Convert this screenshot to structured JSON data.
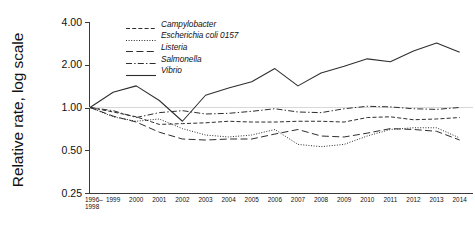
{
  "chart_data": {
    "type": "line",
    "title": "",
    "xlabel": "",
    "ylabel": "Relative rate, log scale",
    "yscale": "log",
    "ylim": [
      0.25,
      4.0
    ],
    "ytick_labels": [
      "4.00",
      "2.00",
      "1.00",
      "0.50",
      "0.25"
    ],
    "ytick_values": [
      4.0,
      2.0,
      1.0,
      0.5,
      0.25
    ],
    "grid": false,
    "reference_line": 1.0,
    "legend_position": "top-center",
    "categories": [
      "1996–\n1998",
      "1999",
      "2000",
      "2001",
      "2002",
      "2003",
      "2004",
      "2005",
      "2006",
      "2007",
      "2008",
      "2009",
      "2010",
      "2011",
      "2012",
      "2013",
      "2014"
    ],
    "x_tick_labels": [
      "1996–|1998",
      "1999",
      "2000",
      "2001",
      "2002",
      "2003",
      "2004",
      "2005",
      "2006",
      "2007",
      "2008",
      "2009",
      "2010",
      "2011",
      "2012",
      "2013",
      "2014"
    ],
    "series": [
      {
        "name": "Campylobacter",
        "style": "dashed-short",
        "values": [
          1.0,
          0.93,
          0.86,
          0.76,
          0.77,
          0.78,
          0.8,
          0.79,
          0.79,
          0.8,
          0.8,
          0.79,
          0.85,
          0.86,
          0.82,
          0.83,
          0.85
        ]
      },
      {
        "name": "Escherichia coli 0157",
        "style": "dotted",
        "values": [
          1.0,
          0.86,
          0.8,
          0.83,
          0.71,
          0.64,
          0.62,
          0.64,
          0.7,
          0.55,
          0.53,
          0.55,
          0.63,
          0.7,
          0.72,
          0.72,
          0.61
        ]
      },
      {
        "name": "Listeria",
        "style": "dashed-long",
        "values": [
          1.0,
          0.87,
          0.79,
          0.67,
          0.6,
          0.59,
          0.6,
          0.6,
          0.65,
          0.7,
          0.63,
          0.62,
          0.66,
          0.71,
          0.7,
          0.68,
          0.59
        ]
      },
      {
        "name": "Salmonella",
        "style": "dash-dot",
        "values": [
          1.0,
          0.95,
          0.85,
          0.92,
          0.95,
          0.9,
          0.91,
          0.94,
          0.98,
          0.93,
          0.92,
          0.98,
          1.02,
          1.01,
          0.98,
          0.97,
          1.0
        ]
      },
      {
        "name": "Vibrio",
        "style": "solid",
        "values": [
          1.0,
          1.28,
          1.42,
          1.12,
          0.8,
          1.22,
          1.37,
          1.52,
          1.88,
          1.42,
          1.75,
          1.95,
          2.2,
          2.1,
          2.5,
          2.85,
          2.45
        ]
      }
    ]
  },
  "legend": {
    "items": [
      {
        "label": "Campylobacter"
      },
      {
        "label": "Escherichia coli 0157"
      },
      {
        "label": "Listeria"
      },
      {
        "label": "Salmonella"
      },
      {
        "label": "Vibrio"
      }
    ]
  }
}
